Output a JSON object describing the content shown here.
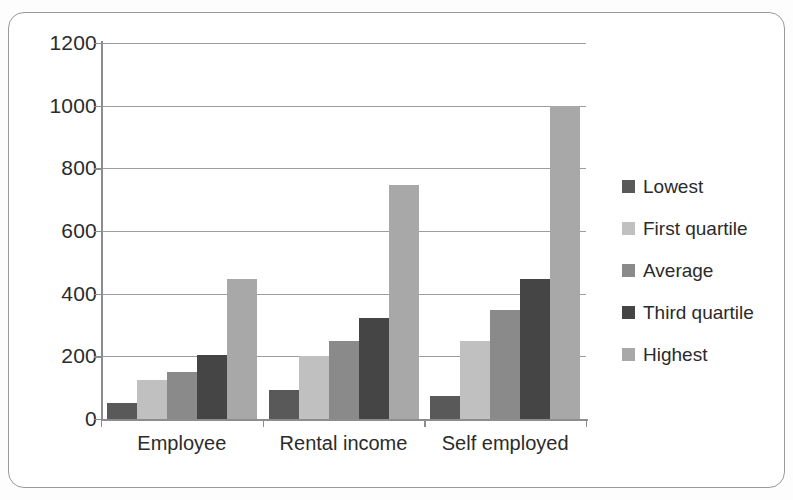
{
  "figure": {
    "frame_color": "#9a9a9a",
    "background": "#ffffff"
  },
  "chart_data": {
    "type": "bar",
    "title": "",
    "subtitle": "",
    "xlabel": "",
    "ylabel": "",
    "categories": [
      "Employee",
      "Rental income",
      "Self employed"
    ],
    "series": [
      {
        "name": "Lowest",
        "color": "#595959",
        "values": [
          50,
          92,
          72
        ]
      },
      {
        "name": "First quartile",
        "color": "#c0c0c0",
        "values": [
          125,
          200,
          248
        ]
      },
      {
        "name": "Average",
        "color": "#8a8a8a",
        "values": [
          150,
          250,
          348
        ]
      },
      {
        "name": "Third quartile",
        "color": "#454545",
        "values": [
          203,
          323,
          446
        ]
      },
      {
        "name": "Highest",
        "color": "#a8a8a8",
        "values": [
          447,
          748,
          1000
        ]
      }
    ],
    "ylim": [
      0,
      1200
    ],
    "ytick_step": 200,
    "ytick_labels": [
      "1200",
      "1000",
      "800",
      "600",
      "400",
      "200",
      "0"
    ],
    "grid": true,
    "grid_axis": "y",
    "legend_position": "right",
    "legend_entries": [
      "Lowest",
      "First quartile",
      "Average",
      "Third quartile",
      "Highest"
    ],
    "bar_orientation": "vertical",
    "grouped": true
  }
}
